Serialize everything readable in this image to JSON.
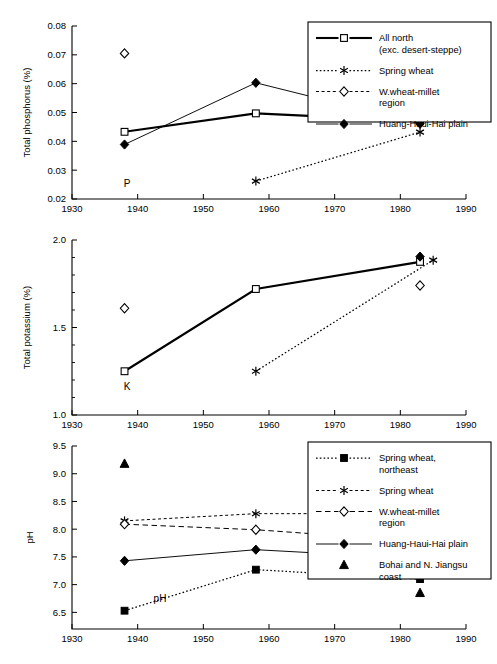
{
  "figure": {
    "background": "#ffffff",
    "foreground": "#000000",
    "panel_count": 3
  },
  "chart_data": [
    {
      "type": "line",
      "panel_id": "phosphorus",
      "title": "",
      "annotation": "P",
      "xlabel": "",
      "ylabel": "Total phosphorus (%)",
      "xlim": [
        1930,
        1990
      ],
      "ylim": [
        0.02,
        0.08
      ],
      "xticks": [
        1930,
        1940,
        1950,
        1960,
        1970,
        1980,
        1990
      ],
      "xticklabels": [
        "1930",
        "1940",
        "1950",
        "1960",
        "1970",
        "1980",
        "1990"
      ],
      "yticks": [
        0.02,
        0.03,
        0.04,
        0.05,
        0.06,
        0.07,
        0.08
      ],
      "yticklabels": [
        "0.02",
        "0.03",
        "0.04",
        "0.05",
        "0.06",
        "0.07",
        "0.08"
      ],
      "grid": false,
      "legend_position": "upper-right",
      "series": [
        {
          "name": "All north (exc. desert-steppe)",
          "marker": "open-square",
          "linestyle": "solid-thick",
          "x": [
            1938,
            1958,
            1983
          ],
          "y": [
            0.0433,
            0.0497,
            0.047
          ]
        },
        {
          "name": "Spring wheat",
          "marker": "asterisk",
          "linestyle": "dotted",
          "x": [
            1958,
            1983
          ],
          "y": [
            0.0262,
            0.0432
          ]
        },
        {
          "name": "W.wheat-millet region",
          "marker": "open-diamond",
          "linestyle": "none",
          "x": [
            1938,
            1983
          ],
          "y": [
            0.0705,
            0.0558
          ]
        },
        {
          "name": "Huang-Haui-Hai plain",
          "marker": "filled-diamond",
          "linestyle": "solid-thin",
          "x": [
            1938,
            1958,
            1983
          ],
          "y": [
            0.0389,
            0.0603,
            0.0461
          ]
        }
      ],
      "legend": [
        {
          "label_line1": "All north",
          "label_line2": "(exc. desert-steppe)",
          "marker": "open-square",
          "linestyle": "solid-thick"
        },
        {
          "label_line1": "Spring wheat",
          "label_line2": "",
          "marker": "asterisk",
          "linestyle": "dotted"
        },
        {
          "label_line1": "W.wheat-millet",
          "label_line2": "region",
          "marker": "open-diamond",
          "linestyle": "dashed"
        },
        {
          "label_line1": "Huang-Haui-Hai plain",
          "label_line2": "",
          "marker": "filled-diamond",
          "linestyle": "solid-thin"
        }
      ]
    },
    {
      "type": "line",
      "panel_id": "potassium",
      "title": "",
      "annotation": "K",
      "xlabel": "",
      "ylabel": "Total potassium (%)",
      "xlim": [
        1930,
        1990
      ],
      "ylim": [
        1.0,
        2.0
      ],
      "xticks": [
        1930,
        1940,
        1950,
        1960,
        1970,
        1980,
        1990
      ],
      "xticklabels": [
        "1930",
        "1940",
        "1950",
        "1960",
        "1970",
        "1980",
        "1990"
      ],
      "yticks": [
        1.0,
        1.5,
        2.0
      ],
      "yticklabels": [
        "1.0",
        "1.5",
        "2.0"
      ],
      "yminorticks": [
        1.1,
        1.2,
        1.3,
        1.4,
        1.6,
        1.7,
        1.8,
        1.9
      ],
      "grid": false,
      "legend_position": "none",
      "series": [
        {
          "name": "All north (exc. desert-steppe)",
          "marker": "open-square",
          "linestyle": "solid-thick",
          "x": [
            1938,
            1958,
            1983
          ],
          "y": [
            1.25,
            1.72,
            1.875
          ]
        },
        {
          "name": "Spring wheat",
          "marker": "asterisk",
          "linestyle": "dotted",
          "x": [
            1958,
            1985
          ],
          "y": [
            1.25,
            1.885
          ]
        },
        {
          "name": "W.wheat-millet region",
          "marker": "open-diamond",
          "linestyle": "none",
          "x": [
            1938,
            1983
          ],
          "y": [
            1.61,
            1.74
          ]
        },
        {
          "name": "Huang-Haui-Hai plain",
          "marker": "filled-diamond",
          "linestyle": "none",
          "x": [
            1983
          ],
          "y": [
            1.905
          ]
        }
      ],
      "legend": []
    },
    {
      "type": "line",
      "panel_id": "ph",
      "title": "",
      "annotation": "pH",
      "xlabel": "",
      "ylabel": "pH",
      "xlim": [
        1930,
        1990
      ],
      "ylim": [
        6.2,
        9.5
      ],
      "xticks": [
        1930,
        1940,
        1950,
        1960,
        1970,
        1980,
        1990
      ],
      "xticklabels": [
        "1930",
        "1940",
        "1950",
        "1960",
        "1970",
        "1980",
        "1990"
      ],
      "yticks": [
        6.5,
        7.0,
        7.5,
        8.0,
        8.5,
        9.0,
        9.5
      ],
      "yticklabels": [
        "6.5",
        "7.0",
        "7.5",
        "8.0",
        "8.5",
        "9.0",
        "9.5"
      ],
      "grid": false,
      "legend_position": "upper-right",
      "series": [
        {
          "name": "Spring wheat, northeast",
          "marker": "filled-square",
          "linestyle": "dotted",
          "x": [
            1938,
            1958,
            1983
          ],
          "y": [
            6.53,
            7.27,
            7.1
          ]
        },
        {
          "name": "Spring wheat",
          "marker": "asterisk",
          "linestyle": "dashed",
          "x": [
            1938,
            1958,
            1983
          ],
          "y": [
            8.15,
            8.28,
            8.28
          ]
        },
        {
          "name": "W.wheat-millet region",
          "marker": "open-diamond",
          "linestyle": "dashed-long",
          "x": [
            1938,
            1958,
            1983
          ],
          "y": [
            8.09,
            7.99,
            7.78
          ]
        },
        {
          "name": "Huang-Haui-Hai plain",
          "marker": "filled-diamond",
          "linestyle": "solid-thin",
          "x": [
            1938,
            1958,
            1983
          ],
          "y": [
            7.43,
            7.63,
            7.47
          ]
        },
        {
          "name": "Bohai and N. Jiangsu coast",
          "marker": "filled-triangle",
          "linestyle": "none",
          "x": [
            1938,
            1983
          ],
          "y": [
            9.18,
            6.85
          ]
        }
      ],
      "legend": [
        {
          "label_line1": "Spring wheat,",
          "label_line2": "northeast",
          "marker": "filled-square",
          "linestyle": "dotted"
        },
        {
          "label_line1": "Spring wheat",
          "label_line2": "",
          "marker": "asterisk",
          "linestyle": "dashed"
        },
        {
          "label_line1": "W.wheat-millet",
          "label_line2": "region",
          "marker": "open-diamond",
          "linestyle": "dashed-long"
        },
        {
          "label_line1": "Huang-Haui-Hai plain",
          "label_line2": "",
          "marker": "filled-diamond",
          "linestyle": "solid-thin"
        },
        {
          "label_line1": "Bohai and N. Jiangsu",
          "label_line2": "coast",
          "marker": "filled-triangle",
          "linestyle": "none"
        }
      ]
    }
  ]
}
